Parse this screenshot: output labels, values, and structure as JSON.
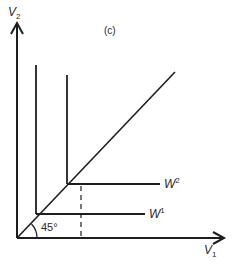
{
  "figure": {
    "panel_label": "(c)",
    "y_axis": {
      "label": "V",
      "subscript": "2"
    },
    "x_axis": {
      "label": "V",
      "subscript": "1"
    },
    "angle_label": "45°",
    "curves": [
      {
        "name": "W",
        "superscript": "1"
      },
      {
        "name": "W",
        "superscript": "2"
      }
    ]
  },
  "colors": {
    "line": "#1e1e1e",
    "text": "#2a2a2a",
    "background": "#ffffff"
  }
}
